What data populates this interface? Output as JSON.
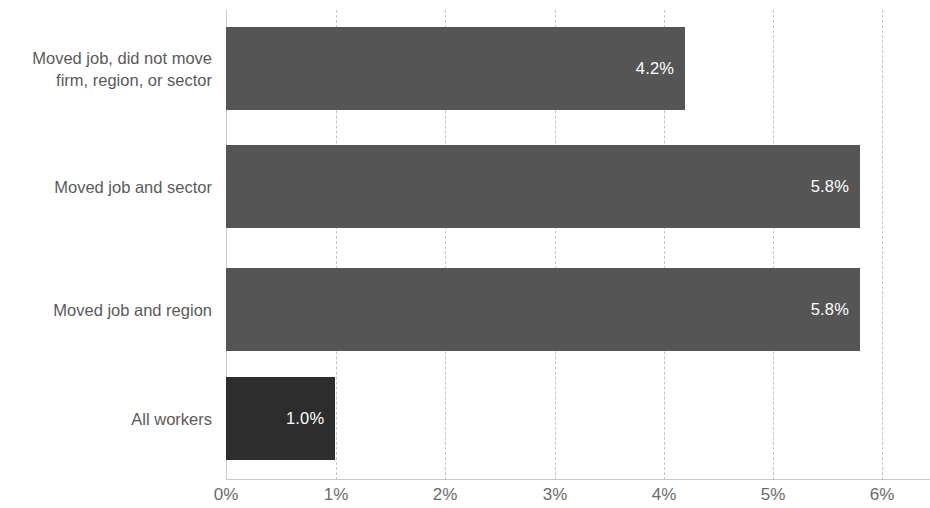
{
  "chart_data": {
    "type": "bar",
    "orientation": "horizontal",
    "title": "",
    "subtitle": "",
    "xlabel": "",
    "ylabel": "",
    "xlim": [
      0,
      6
    ],
    "xticks": [
      "0%",
      "1%",
      "2%",
      "3%",
      "4%",
      "5%",
      "6%"
    ],
    "xtick_values": [
      0,
      1,
      2,
      3,
      4,
      5,
      6
    ],
    "grid": "vertical-dashed",
    "legend": "none",
    "categories": [
      "Moved job, did not move\nfirm, region, or sector",
      "Moved job and sector",
      "Moved job and region",
      "All workers"
    ],
    "values": [
      4.2,
      5.8,
      5.8,
      1.0
    ],
    "value_labels": [
      "4.2%",
      "5.8%",
      "5.8%",
      "1.0%"
    ],
    "bar_colors": [
      "#555555",
      "#555555",
      "#555555",
      "#2d2d2d"
    ],
    "bars": [
      {
        "category": "Moved job, did not move\nfirm, region, or sector",
        "value": 4.2,
        "label": "4.2%",
        "color": "#555555"
      },
      {
        "category": "Moved job and sector",
        "value": 5.8,
        "label": "5.8%",
        "color": "#555555"
      },
      {
        "category": "Moved job and region",
        "value": 5.8,
        "label": "5.8%",
        "color": "#555555"
      },
      {
        "category": "All workers",
        "value": 1.0,
        "label": "1.0%",
        "color": "#2d2d2d"
      }
    ],
    "colors": {
      "bar_default": "#555555",
      "bar_highlight": "#2d2d2d",
      "value_label": "#ffffff",
      "category_label": "#5a5a5a",
      "tick_label": "#6b6b6b",
      "gridline": "#c4c4c4",
      "axis_line": "#c9c9c9",
      "background": "#ffffff"
    }
  }
}
